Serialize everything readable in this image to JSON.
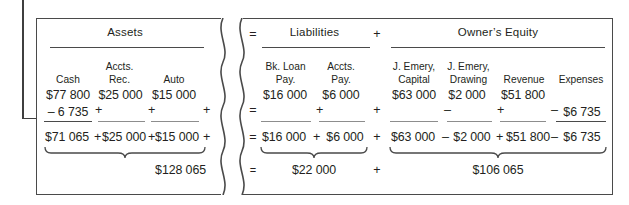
{
  "figure": {
    "type": "accounting-equation-worksheet",
    "arrow_label": "",
    "sections": [
      {
        "id": "assets",
        "title": "Assets",
        "columns": [
          {
            "label_line1": "",
            "label_line2": "Cash",
            "opening": "$77 800",
            "change": "– 6 735",
            "operator_after": "+",
            "total": "$71 065"
          },
          {
            "label_line1": "Accts.",
            "label_line2": "Rec.",
            "opening": "$25 000",
            "change": "",
            "operator_after": "+",
            "total": "$25 000"
          },
          {
            "label_line1": "",
            "label_line2": "Auto",
            "opening": "$15 000",
            "change": "",
            "operator_after": "+",
            "total": "$15 000"
          }
        ],
        "subtotal": "$128 065"
      },
      {
        "id": "liabilities",
        "title": "Liabilities",
        "columns": [
          {
            "label_line1": "Bk. Loan",
            "label_line2": "Pay.",
            "opening": "$16 000",
            "change": "",
            "operator_after": "+",
            "total": "$16 000"
          },
          {
            "label_line1": "Accts.",
            "label_line2": "Pay.",
            "opening": "$6 000",
            "change": "",
            "operator_after": "+",
            "total": "$6 000"
          }
        ],
        "subtotal": "$22 000"
      },
      {
        "id": "owners-equity",
        "title": "Owner’s Equity",
        "columns": [
          {
            "label_line1": "J. Emery,",
            "label_line2": "Capital",
            "opening": "$63 000",
            "change": "",
            "operator_after": "–",
            "total": "$63 000"
          },
          {
            "label_line1": "J. Emery,",
            "label_line2": "Drawing",
            "opening": "$2 000",
            "change": "",
            "operator_after": "+",
            "total": "$2 000"
          },
          {
            "label_line1": "",
            "label_line2": "Revenue",
            "opening": "$51 800",
            "change": "",
            "operator_after": "–",
            "total": "$51 800"
          },
          {
            "label_line1": "",
            "label_line2": "Expenses",
            "opening": "",
            "change": "$6 735",
            "operator_after": "",
            "total": "$6 735"
          }
        ],
        "subtotal": "$106 065"
      }
    ],
    "equation_operators": {
      "equals": "=",
      "plus": "+",
      "minus": "–"
    },
    "equals_signs": [
      "=",
      "=",
      "=",
      "="
    ],
    "plus_signs": [
      "+",
      "+",
      "+",
      "+"
    ],
    "colors": {
      "ink": "#231f20",
      "rule": "#4a4a4a",
      "border": "#4a4a4a",
      "background": "#ffffff"
    }
  }
}
